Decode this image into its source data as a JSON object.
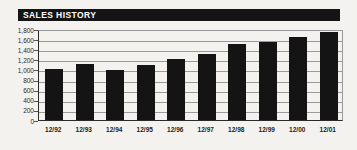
{
  "page": {
    "background_color": "#f4f2ee"
  },
  "chart_style": {
    "title_bar_color": "#141414",
    "title_text_color": "#ffffff",
    "bar_color": "#141414",
    "gridline_color": "#9a9a9a",
    "axis_color": "#2a2a2a"
  },
  "chart_data": {
    "type": "bar",
    "title": "SALES HISTORY",
    "categories": [
      "12/92",
      "12/93",
      "12/94",
      "12/95",
      "12/96",
      "12/97",
      "12/98",
      "12/99",
      "12/00",
      "12/01"
    ],
    "values": [
      1000,
      1100,
      980,
      1090,
      1200,
      1300,
      1510,
      1540,
      1640,
      1740
    ],
    "xlabel": "",
    "ylabel": "",
    "ylim": [
      0,
      1800
    ],
    "ytick_step": 200,
    "ytick_labels": [
      "0",
      "200",
      "400",
      "600",
      "800",
      "1,000",
      "1,200",
      "1,400",
      "1,600",
      "1,800"
    ],
    "grid": true,
    "legend": false,
    "series_color": "black",
    "orientation": "vertical"
  }
}
